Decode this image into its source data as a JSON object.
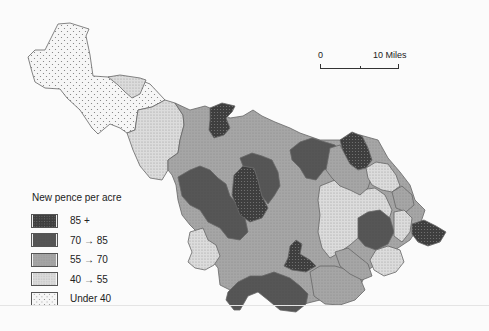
{
  "map": {
    "title": "New pence per acre",
    "scale_bar": {
      "start_label": "0",
      "end_label": "10 Miles"
    },
    "legend": [
      {
        "label": "85 +",
        "class": "85+",
        "fill": "#3a3a3a",
        "pattern": "dense-dark"
      },
      {
        "label": "70  → 85",
        "class": "70-85",
        "fill": "#555555",
        "pattern": "solid-dark"
      },
      {
        "label": "55  → 70",
        "class": "55-70",
        "fill": "#a0a0a0",
        "pattern": "medium-grey"
      },
      {
        "label": "40  → 55",
        "class": "40-55",
        "fill": "#d4d4d4",
        "pattern": "light-grey"
      },
      {
        "label": "Under  40",
        "class": "under-40",
        "fill": "#f4f4f4",
        "pattern": "sparse-dots"
      }
    ],
    "colors": {
      "c85": "#3a3a3a",
      "c70": "#555555",
      "c55": "#a0a0a0",
      "c40": "#d4d4d4",
      "cUnder": "#f4f4f4",
      "border": "#666666"
    }
  }
}
